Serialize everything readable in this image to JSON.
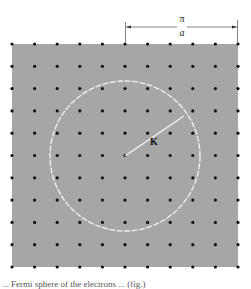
{
  "figure": {
    "background_color": "#a6a6a6",
    "square": {
      "x": 12,
      "y": 44,
      "width": 226,
      "height": 223
    },
    "lattice": {
      "rows": 11,
      "cols": 11,
      "spacing_x": 22.6,
      "spacing_y": 22.3,
      "dot_color": "#111111",
      "dot_radius": 1.6
    },
    "circle": {
      "cx": 125,
      "cy": 156,
      "r": 75,
      "color": "#f2f2f2",
      "style": "dashed"
    },
    "radius_line": {
      "x1": 125,
      "y1": 156,
      "x2": 184,
      "y2": 116,
      "label": "K"
    },
    "dimension": {
      "x1": 125,
      "x2": 238,
      "y": 27,
      "numerator": "π",
      "denominator": "a"
    }
  },
  "caption": "... Fermi sphere of the electrons ... (fig.)"
}
